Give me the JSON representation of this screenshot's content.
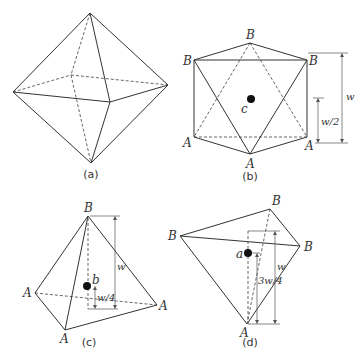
{
  "panels": {
    "a": {
      "caption": "(a)",
      "description": "Octahedron in perspective"
    },
    "b": {
      "caption": "(b)",
      "vertex_labels": {
        "B_top": "B",
        "B_left": "B",
        "B_right": "B",
        "A_left": "A",
        "A_bottom": "A",
        "A_right": "A"
      },
      "center_label": "c",
      "dim_full": "w",
      "dim_half": "w/2"
    },
    "c": {
      "caption": "(c)",
      "vertex_labels": {
        "B_top": "B",
        "A_left": "A",
        "A_right": "A",
        "A_bottom": "A"
      },
      "center_label": "b",
      "dim_full": "w",
      "dim_quarter": "w/4"
    },
    "d": {
      "caption": "(d)",
      "vertex_labels": {
        "B_top": "B",
        "B_left": "B",
        "B_right": "B",
        "A_bottom": "A"
      },
      "center_label": "a",
      "dim_full": "w",
      "dim_three_quarter": "3w/4"
    }
  },
  "colors": {
    "line": "#333333",
    "dot": "#111111",
    "background": "#ffffff"
  }
}
